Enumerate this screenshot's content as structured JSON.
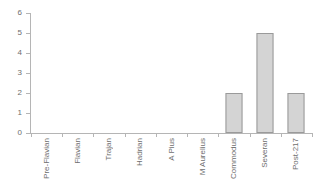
{
  "chart_data": {
    "type": "bar",
    "title": "",
    "subtitle": "",
    "xlabel": "",
    "ylabel": "",
    "categories": [
      "Pre-Flavian",
      "Flavian",
      "Trajan",
      "Hadrian",
      "A Pius",
      "M Aurelius",
      "Commodus",
      "Severan",
      "Post-217"
    ],
    "values": [
      0,
      0,
      0,
      0,
      0,
      0,
      2,
      5,
      2
    ],
    "ylim": [
      0,
      6
    ],
    "yticks": [
      0,
      1,
      2,
      3,
      4,
      5,
      6
    ],
    "ytick_labels": [
      "0",
      "1",
      "2",
      "3",
      "4",
      "5",
      "6"
    ],
    "grid": false,
    "legend": false,
    "legend_position": "none",
    "annotations": [],
    "colors": {
      "bar_fill": "#d4d4d4",
      "bar_border": "#9a9a9a",
      "axis": "#b5b5b5",
      "text": "#6e6e6e",
      "background": "#ffffff"
    }
  }
}
